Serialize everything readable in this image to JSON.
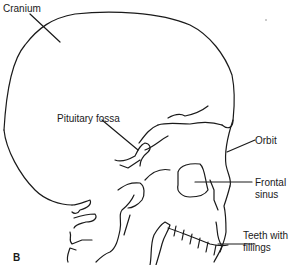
{
  "diagram": {
    "type": "lateral skull line drawing",
    "panel_label": "B",
    "line_color": "#1a1a1a",
    "background": "#ffffff",
    "labels": {
      "cranium": "Cranium",
      "pituitary_fossa": "Pituitary fossa",
      "orbit": "Orbit",
      "frontal_sinus_line1": "Frontal",
      "frontal_sinus_line2": "sinus",
      "teeth_line1": "Teeth with",
      "teeth_line2": "fillings"
    }
  }
}
